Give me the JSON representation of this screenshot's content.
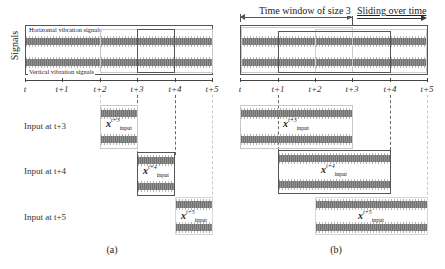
{
  "panel_a": {
    "y_axis_label": "Signals",
    "signal_labels": {
      "horizontal": "Horizontal vibration signals",
      "vertical": "Vertical vibration signals"
    },
    "ticks": [
      {
        "x": 25,
        "label": "t"
      },
      {
        "x": 62,
        "label": "t+1"
      },
      {
        "x": 100,
        "label": "t+2"
      },
      {
        "x": 137,
        "label": "t+3"
      },
      {
        "x": 175,
        "label": "t+4"
      },
      {
        "x": 212,
        "label": "t+5"
      }
    ],
    "inputs": [
      {
        "label": "Input at t+3",
        "symbol": "x",
        "sup": "t+3",
        "sub": "input",
        "from": 100,
        "to": 137
      },
      {
        "label": "Input at t+4",
        "symbol": "x",
        "sup": "t+4",
        "sub": "input",
        "from": 137,
        "to": 175
      },
      {
        "label": "Input at t+5",
        "symbol": "x",
        "sup": "t+5",
        "sub": "input",
        "from": 175,
        "to": 212
      }
    ],
    "caption": "(a)"
  },
  "panel_b": {
    "window_label": "Time window of size 3",
    "sliding_label": "Sliding over time",
    "ticks": [
      {
        "x": 240,
        "label": "t"
      },
      {
        "x": 278,
        "label": "t+1"
      },
      {
        "x": 315,
        "label": "t+2"
      },
      {
        "x": 352,
        "label": "t+3"
      },
      {
        "x": 390,
        "label": "t+4"
      },
      {
        "x": 427,
        "label": "t+5"
      }
    ],
    "inputs": [
      {
        "symbol": "x",
        "sup": "t+3",
        "sub": "input",
        "from": 240,
        "to": 352
      },
      {
        "symbol": "x",
        "sup": "t+4",
        "sub": "input",
        "from": 278,
        "to": 390
      },
      {
        "symbol": "x",
        "sup": "t+5",
        "sub": "input",
        "from": 315,
        "to": 427
      }
    ],
    "caption": "(b)"
  },
  "colors": {
    "signal": "#8f8f8f",
    "dark_box": "#555555",
    "light_box": "#c8c8c8",
    "axis": "#444444"
  }
}
